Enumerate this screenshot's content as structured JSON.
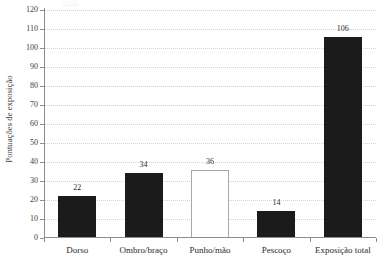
{
  "chart_data": {
    "type": "bar",
    "title": "",
    "xlabel": "",
    "ylabel": "Pontuações de exposição",
    "categories": [
      "Dorso",
      "Ombro/braço",
      "Punho/mão",
      "Pescoço",
      "Exposição total"
    ],
    "values": [
      22,
      34,
      36,
      14,
      106
    ],
    "value_labels": [
      "22",
      "34",
      "36",
      "14",
      "106"
    ],
    "bar_styles": [
      "filled",
      "filled",
      "hollow",
      "filled",
      "filled"
    ],
    "ylim": [
      0,
      120
    ],
    "ytick_step": 10,
    "yticks": [
      0,
      10,
      20,
      30,
      40,
      50,
      60,
      70,
      80,
      90,
      100,
      110,
      120
    ],
    "ytick_labels": [
      "0",
      "10",
      "20",
      "30",
      "40",
      "50",
      "60",
      "70",
      "80",
      "90",
      "100",
      "110",
      "120"
    ],
    "grid": true,
    "grid_axis": "y",
    "grid_style": "dotted",
    "legend": null,
    "legend_position": "none",
    "colors": {
      "bar_fill": "#1b1b1b",
      "bar_hollow_fill": "#ffffff",
      "bar_hollow_border": "#a8a8a8",
      "gridline": "#d2d2d2",
      "axis": "#8d8d8d",
      "text": "#2b2b2b",
      "background": "#ffffff"
    }
  }
}
